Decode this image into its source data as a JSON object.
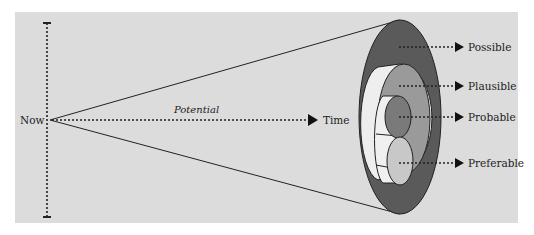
{
  "diagram": {
    "type": "futures-cone",
    "origin_label": "Now",
    "axis_label": "Time",
    "cone_label": "Potential",
    "futures": [
      {
        "label": "Possible",
        "color": "#5a5a5a"
      },
      {
        "label": "Plausible",
        "color": "#9a9a9a"
      },
      {
        "label": "Probable",
        "color": "#7a7a7a"
      },
      {
        "label": "Preferable",
        "color": "#c8c8c8"
      }
    ],
    "colors": {
      "panel_background": "#dcdcdc",
      "cone_inner_band": "#eeeeee",
      "line": "#222222"
    }
  }
}
